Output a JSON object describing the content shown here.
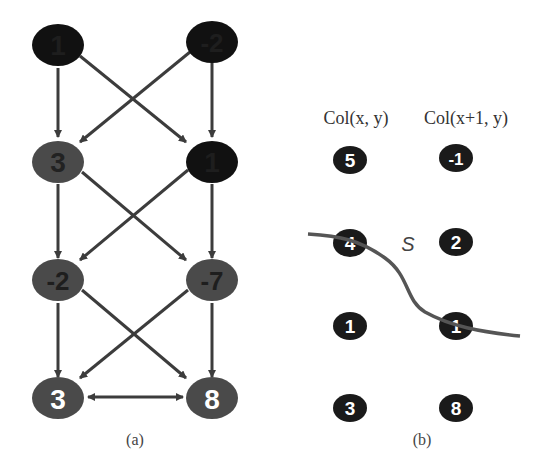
{
  "panel_a": {
    "caption": "(a)",
    "nodes": [
      {
        "id": "r0c0",
        "label": "1",
        "fill": "#111111",
        "text": "#1a1a1a"
      },
      {
        "id": "r0c1",
        "label": "-2",
        "fill": "#111111",
        "text": "#1a1a1a"
      },
      {
        "id": "r1c0",
        "label": "3",
        "fill": "#4a4a4a",
        "text": "#222222"
      },
      {
        "id": "r1c1",
        "label": "1",
        "fill": "#111111",
        "text": "#1a1a1a"
      },
      {
        "id": "r2c0",
        "label": "-2",
        "fill": "#4a4a4a",
        "text": "#1e1e1e"
      },
      {
        "id": "r2c1",
        "label": "-7",
        "fill": "#4a4a4a",
        "text": "#1e1e1e"
      },
      {
        "id": "r3c0",
        "label": "3",
        "fill": "#4a4a4a",
        "text": "#ffffff"
      },
      {
        "id": "r3c1",
        "label": "8",
        "fill": "#4a4a4a",
        "text": "#ffffff"
      }
    ]
  },
  "panel_b": {
    "caption": "(b)",
    "header_left": "Col(x, y)",
    "header_right": "Col(x+1, y)",
    "curve_label": "S",
    "left_column": [
      "5",
      "4",
      "1",
      "3"
    ],
    "right_column": [
      "-1",
      "2",
      "1",
      "8"
    ],
    "node_fill": "#1a1a1a",
    "curve_color": "#555555"
  }
}
